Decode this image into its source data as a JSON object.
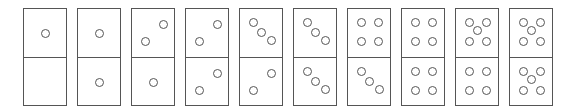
{
  "dominoes": [
    {
      "top": 1,
      "bottom": 0
    },
    {
      "top": 1,
      "bottom": 1
    },
    {
      "top": 2,
      "bottom": 1
    },
    {
      "top": 2,
      "bottom": 2
    },
    {
      "top": 3,
      "bottom": 2
    },
    {
      "top": 3,
      "bottom": 3
    },
    {
      "top": 4,
      "bottom": 3
    },
    {
      "top": 4,
      "bottom": 4
    },
    {
      "top": 5,
      "bottom": 4
    },
    {
      "top": 5,
      "bottom": 5
    }
  ],
  "colors": {
    "stroke": "#555555",
    "background": "#ffffff"
  }
}
